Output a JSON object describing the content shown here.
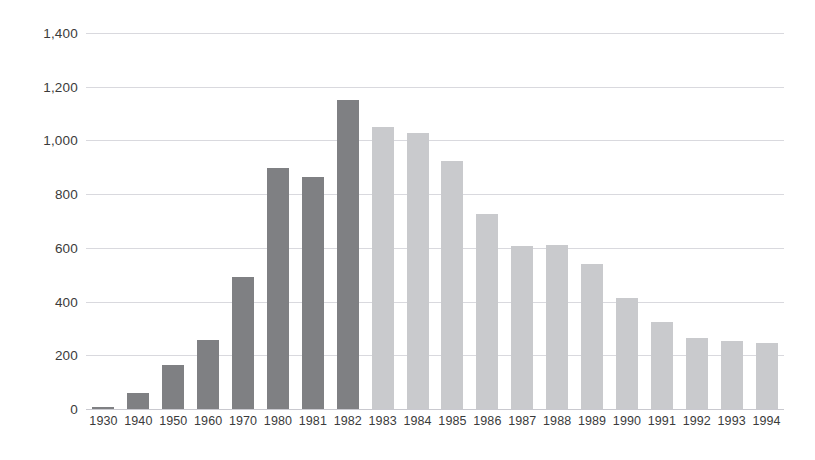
{
  "chart_data": {
    "type": "bar",
    "title": "",
    "subtitle": "",
    "xlabel": "",
    "ylabel": "",
    "categories": [
      "1930",
      "1940",
      "1950",
      "1960",
      "1970",
      "1980",
      "1981",
      "1982",
      "1983",
      "1984",
      "1985",
      "1986",
      "1987",
      "1988",
      "1989",
      "1990",
      "1991",
      "1992",
      "1993",
      "1994"
    ],
    "values": [
      8,
      58,
      165,
      258,
      490,
      898,
      865,
      1150,
      1050,
      1028,
      925,
      727,
      606,
      612,
      540,
      412,
      325,
      265,
      252,
      247
    ],
    "bar_colors": [
      "#7f8083",
      "#7f8083",
      "#7f8083",
      "#7f8083",
      "#7f8083",
      "#7f8083",
      "#7f8083",
      "#7f8083",
      "#c9cacd",
      "#c9cacd",
      "#c9cacd",
      "#c9cacd",
      "#c9cacd",
      "#c9cacd",
      "#c9cacd",
      "#c9cacd",
      "#c9cacd",
      "#c9cacd",
      "#c9cacd",
      "#c9cacd"
    ],
    "ylim": [
      0,
      1400
    ],
    "ytick_values": [
      0,
      200,
      400,
      600,
      800,
      1000,
      1200,
      1400
    ],
    "ytick_labels": [
      "0",
      "200",
      "400",
      "600",
      "800",
      "1,000",
      "1,200",
      "1,400"
    ],
    "grid": true,
    "grid_axis": "y",
    "legend": null,
    "legend_position": "none",
    "annotations": [],
    "palette": {
      "dark_series": "#7f8083",
      "light_series": "#c9cacd",
      "gridline": "#d9d9de",
      "axis_text": "#3b3b3b",
      "background": "#ffffff"
    }
  }
}
